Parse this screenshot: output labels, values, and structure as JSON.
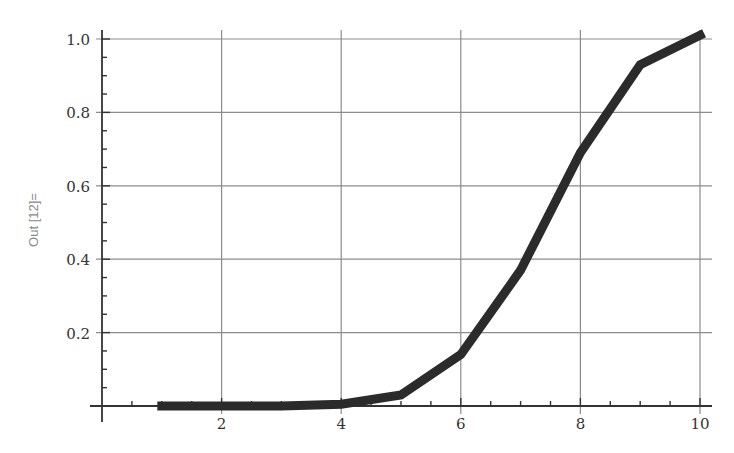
{
  "cell": {
    "out_label": "Out [12]="
  },
  "chart_data": {
    "type": "line",
    "title": "",
    "xlabel": "",
    "ylabel": "",
    "x": [
      1,
      2,
      3,
      4,
      5,
      6,
      7,
      8,
      9,
      10
    ],
    "series": [
      {
        "name": "series-1",
        "values": [
          0.0,
          0.0,
          0.0,
          0.005,
          0.03,
          0.14,
          0.37,
          0.69,
          0.93,
          1.01
        ],
        "color": "#2b2b2b"
      }
    ],
    "xlim": [
      0,
      10.2
    ],
    "ylim": [
      0,
      1.05
    ],
    "x_ticks": [
      2,
      4,
      6,
      8,
      10
    ],
    "x_tick_labels": [
      "2",
      "4",
      "6",
      "8",
      "10"
    ],
    "y_ticks": [
      0.2,
      0.4,
      0.6,
      0.8,
      1.0
    ],
    "y_tick_labels": [
      "0.2",
      "0.4",
      "0.6",
      "0.8",
      "1.0"
    ],
    "grid": true,
    "legend": "none"
  },
  "style": {
    "line_color": "#2b2b2b",
    "grid_color": "#8c8c8c",
    "axis_color": "#333333",
    "text_color": "#333333"
  }
}
